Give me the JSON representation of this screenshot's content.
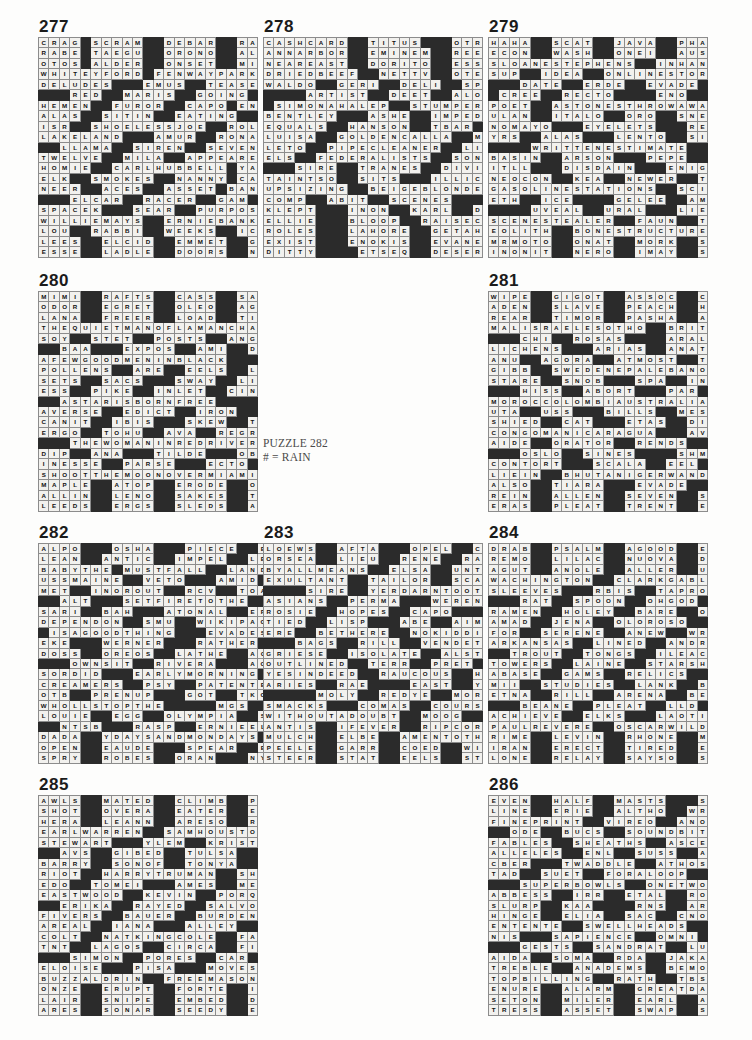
{
  "page": {
    "kind": "crossword-answer-key",
    "width": 752,
    "height": 1040,
    "ink_color": "#101010",
    "block_color": "#2b2b2b",
    "cell_color": "#f2f1ee"
  },
  "center_note": {
    "line1": "PUZZLE 282",
    "line2": "# = RAIN"
  },
  "puzzles": [
    {
      "number": "277",
      "x": 38,
      "y": 18,
      "cols": 21,
      "rows": 23,
      "rows_data": [
        "CRAG#SCRAM##DEBAR##RASP",
        "RABE#TAEGU##ORONO##ALAE",
        "OTOS#ALDER##ONSET##MICE",
        "WHITEYFORD#FENWAYPARK",
        "DELUDES###EMUS##TEASES",
        "###RED##MARIS##GOING###",
        "HEMEN##FUROR##CAPO#ENNA",
        "ALAS##SITIN##EATING##OUR",
        "ISR##SHOELESSJOE##ROLLO",
        "LAKELAND###AMUR##RONALD",
        "##LLAMA##SIREN##SEVEN##",
        "TWELVE##MILA##APPEARED",
        "HOMIE##CARLHUBBELL#YAY",
        "ELK##SMOKES##NANNY#CARE",
        "NEER##ACES##ASSET#BANNS",
        "###ELCAR##RACER##GAM###",
        "SPACEK###SEAR##PURPOSE",
        "WILLIEMAYS##ERNIEBANKS",
        "LOU##RABBI##WEEKS##ICET",
        "LEES##ELCID##EMMET##GLEE",
        "ESSE##LADLE##DOORS##NETS"
      ]
    },
    {
      "number": "278",
      "x": 263,
      "y": 18,
      "cols": 21,
      "rows": 23,
      "rows_data": [
        "CASHCARD##TITUS###OTROS",
        "ANNARBOR##EMINEM##REEVE",
        "NEAREAST##DORITO##ESSEX",
        "DRIEDBEEF##NETTV##OTERI",
        "WALDO##GERI##DELI##SPAWN",
        "####ARTIST##DEET##ALOE",
        "#SIMONAHALEP##STUMPERS",
        "BENTLEY###ASHE##IMPEDES",
        "EQUALS##HANSON##TBAR###",
        "LUISA##GOLDENCALLA##MTA",
        "LETO##PIPECLEANER##LIES",
        "ELS##FEDERALISTS##SONES",
        "###SIRE##TRANES##DIVINE",
        "TAINTSO##SITS###ILLICIT",
        "UPSIZING##BEIGEBLONDE#",
        "COMP##ABIT##SCENES#####",
        "KLEPT###INON##KARL##DOWSE",
        "ELLIE###BLOOP##RAISECAIN",
        "ROLES###LAHORE##GETAHINT",
        "EXIST###ENOKIS##EVANESCE",
        "DITTY####ETSEQ##DESERTER"
      ]
    },
    {
      "number": "279",
      "x": 488,
      "y": 18,
      "cols": 21,
      "rows": 23,
      "rows_data": [
        "HAHA##SCAT##JAVA##PHASES",
        "ECON##WASH##ONEI##AUSTRO",
        "SLOANESTEPHENS##INHAND",
        "SUP##IDEA##ONLINESTORES",
        "###DATE##ERDE##EVADE###",
        "#CREE##RECTO####ENO##SST",
        "POET##ASTONESTHROWAWAY",
        "ULAN##ITALO##ORO##SNEERS",
        "NOMAYO###EYELETS###REDO",
        "YRS##ALAS###LENTO##SITIN",
        "####WRITTENESTIMATE####",
        "BASIN##ARSON###PEPE##EON",
        "ITLL###DISDAIN###ENIGMA",
        "NEOCON##KEA##NEWER##TONY",
        "GASOLINESTATIONS##SCIS",
        "ETH##ICE####GELEE##AMES#",
        "####UVEAL##URAL###LIEN##",
        "SCENESTEALER##FAUN##TVA",
        "EOLITH##BONESTRUCTURES",
        "MRMOTO##ONAT##MORK##SIRI",
        "INONIT##NERO##IMAY##SCAN"
      ]
    },
    {
      "number": "280",
      "x": 38,
      "y": 272,
      "cols": 21,
      "rows": 23,
      "rows_data": [
        "MIMI##RAFTS##CASS##SADHU",
        "ODOR##EGRET##OLEO##AGAIN",
        "LANA##FREER##LOAD##TINGE",
        "THEQUIETMANOFLAMANCHA",
        "SOY##STET##POSTS##ANGELS",
        "##BAA###EXPOS##AMI##DYE",
        "AFEWGOODMENINBLACK####",
        "POLLENS##ARE##EELS##LARA",
        "SETS##SACS###SWAY##LIBEL",
        "ESS##PIKE##INLET##CINEMA",
        "##ASTARISBORNFREE#####",
        "AVERSE##EDICT##IRON##GAB",
        "CANIT##IBIS###SKEW##TRIO",
        "ERGO##TOHU##AVA##REGRADE",
        "###THEWOMANINREDRIVER",
        "DIP##ANA###TILDE###OBI#",
        "INESSE##PARSE###ECTO##TAM",
        "SHOOTTHEMOONOVERMIAMI",
        "MAPLE##ATOP##ERODE##OTIS",
        "ALLIN##LENO##SAKES##TEST",
        "LEEDS##ERGS##SLEDS##ASHY"
      ]
    },
    {
      "number": "281",
      "x": 488,
      "y": 272,
      "cols": 21,
      "rows": 23,
      "rows_data": [
        "WIPE##GIGOT##ASSOC##CPUS",
        "ADEN##SLAVE##PEACH##HANA",
        "REAR##TIMOR##PASHA##AKIN",
        "MALISRAELESOTHO##BRITT",
        "###CHI##ROSAS####ARALSEA",
        "LICHENS###ARIAS##ANAT##",
        "ANU##AGORA##ATMOST##TAPA",
        "GIBB##SWEDENEPALEBANON",
        "STARE##SNOB###SPA##INGOT",
        "###HISS##ABORT###PAR##ORR",
        "MOROCCOLOMBIAUSTRALIA",
        "UTA##USS###BILLS##MESA##",
        "SHIED##CAT###ETAS##DITTO",
        "CONGOMANICARAGUA###AVER",
        "AIDE##ORATOR##RENDS###IRE",
        "###OSLO##SINES####SHMEARS",
        "CONTORT###SCALA##EEL###",
        "LIEIN##BHUTANIGERWANDA",
        "ALSO##TIARA###EVADE##PERP",
        "REIN##ALLEN##SEVEN##SEES",
        "ERAS##PLEAT##TRENT##EDGE"
      ]
    },
    {
      "number": "282",
      "x": 38,
      "y": 524,
      "cols": 23,
      "rows": 23,
      "note": "# = RAIN",
      "rows_data": [
        "ALPO###OSHA###PIECE##EDAM",
        "LEAN##ANTIC##IMPEL##LENO",
        "BABYTHE#MUSTFALL##LAND",
        "USSMAINE##VETO###AMID###",
        "MET##INOROUT##RCV##TOAST",
        "##ALT###SETFIRETOTHE#",
        "SARI##BAH###ATONAL##ERE",
        "DEPENDON##SMU##WIKIPAGE",
        "#ISAGOODTHING###EVADES",
        "EKE###WERNER###RATHER###",
        "DOSS##OREOS##LATHE##ACLU",
        "###OWNSIT##RIVERA###AOK",
        "SORDID###EARLYMORNING#",
        "CREAMERS##PSY##PATENTEE",
        "OTB##PRENUP###GOT##TKOS",
        "WHOLLSTOPTHE#####MGS###",
        "LOUIE##EGG##OLYMPIA##SEA",
        "##NTSB###RASP##ERNIEELS",
        "DADA##YDAYSANDMONDAYS",
        "OPEN##EAUDE###SPEAR##ELSE",
        "SPRY##ROBES##ORAN###NYET"
      ]
    },
    {
      "number": "283",
      "x": 263,
      "y": 524,
      "cols": 21,
      "rows": 23,
      "rows_data": [
        "LOEWS##AFTA###OPEL##CREST",
        "ORSEA##LIEU##RENE##RASTA",
        "BYALLMEANS##ELSA##UNTIL",
        "EXULTANT##TAILOR##SCARE",
        "####SIRE##YERDARNTOOTIN",
        "ASIANS##PERMA###WERENT",
        "ROSIE##HOPES##CAPO#####",
        "TIED##LISP###ABE##AIMEE",
        "ERE##BETHERE##NOKIDDING",
        "###BAGS##RILL##VENDETTA",
        "GRIESE##ISOLATE##ALSTON",
        "OUTLINED##TERR##PRET###",
        "YESINDEED##RAUCOUS##HES",
        "ARIES##RAE####EAST##YEAH",
        "#####MOLY##REDYE##MORRO",
        "SMACKS###COMAS##COURSE",
        "WITHOUTADOUBT##MOOG###",
        "ANTIS##IFEVER##RIPCORDS",
        "MULCH##ELBE##AMENTOTHAT",
        "PEELE##GARR##COED##WIELD",
        "STEER##STAT##EELS##STAYS"
      ]
    },
    {
      "number": "284",
      "x": 488,
      "y": 524,
      "cols": 21,
      "rows": 23,
      "rows_data": [
        "DRAB##PSALM##AGOOD##EGIS",
        "REMO##LILAC##NUOVA##DATA",
        "AGUT##ANOLE##ALLER##URAL",
        "WACHINGTON##CLARKGABLE",
        "SLEEVES###RBIS##TAPROOM",
        "###RAT##SPOON##OHGOD###",
        "RAMEN##HOLEY##BARE##OCHO",
        "AMAD##JENA##OLOROSO##HOL",
        "FOR##SERENE##ANEW##WRUNG",
        "ARKANSAS##LINED##ANDREA",
        "##TROUT##TONGS##ILEAC##",
        "TOWERS##LAINE##STARSHIP",
        "ABASE##GAMS##RELICS##IDS",
        "MII##STUDIES##LANK##BLOT",
        "ETNA##RILL##ARENA##BELLS",
        "###BEANE##PLEAT##LLD###",
        "ACHIEVE##ELKS###LAOTIAN",
        "PAULREVERE##OSCARWILDE",
        "RIME##LEVIN##RHONE##MOOD",
        "IRAN##ERECT##TIRED##ESSO",
        "LONE##RELAY##SAYSO##STEP"
      ]
    },
    {
      "number": "285",
      "x": 38,
      "y": 776,
      "cols": 21,
      "rows": 23,
      "rows_data": [
        "AWLS##MATED##CLIMB##POPS",
        "SHOT##OVERA##EATER##EDIT",
        "HERA##LEANN##ARESO##RENO",
        "EARLWARREN##SAMHOUSTON",
        "STEWART###YLEM##KRISTY",
        "##AVS##GIBED##TULSA####",
        "BARRY##SONOF##TONYA##STE",
        "RIOT##HARRYTRUMAN##SHUL",
        "EDO##TOMEI###AMES##MEATS",
        "EASTWOOD##KEVIN##PORQUE",
        "##ERIKA##RAYED##SALVO##",
        "FIVERS##BAUER##BURDENED",
        "AREAL##IANA###ALLEY##ERE",
        "COLT##NATKINGCOLE##FAIL",
        "TNT##LAGOS##CIRCA##FILET",
        "###SIMON##PORES##CAR####",
        "ELOISE###PISA###MOVESUP",
        "BUZZALDRIN##FREEMASONS",
        "ONZE##ERUPT##FORTE##INGA",
        "LAIR##SNIPE##EMBED##DIET",
        "ARES##SONAR##SEEDY##EARS"
      ]
    },
    {
      "number": "286",
      "x": 488,
      "y": 776,
      "cols": 21,
      "rows": 23,
      "rows_data": [
        "EVEN##HALF##MASTS###SATIE",
        "LINE##ERIE##ALTHO##WRONG",
        "FINEPRINT##VIREO##ANODE",
        "##ODE##BUCS##SOUNDBITES",
        "FABLES##SHEATHS##ASCENT",
        "ALLELES##ENL##SUSS##ARTS",
        "CBER###TWADDLE##ATHOS###",
        "TAD##SUET##FORALOOP##APE",
        "###SUPERBOWLS##ONETWOS",
        "ABBESS##IRR##ETAL##ROAST",
        "SLURP##KAA####RNS##ARISE",
        "HINGE##ELIA##SAC##CNOTES",
        "ENTENTE##SWELLHEADS####",
        "NIS###SAPIENCE##OMNI##KEA",
        "###GESTS##SANDRAT##LUTZ",
        "AIDA##SOMA##RDA##JAKARTA",
        "TREBLE##ANADEMS##BEMOAN",
        "TOPBILLING##RATH##TBS##",
        "ENURE##ALARM##GREATDANE",
        "SETON##MILER##EARL##AWAY",
        "TRESS##ASSET##SWAP##SAGE"
      ]
    }
  ]
}
